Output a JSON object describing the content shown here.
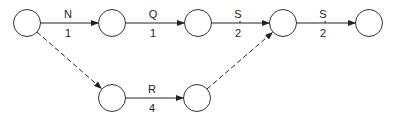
{
  "diagram": {
    "type": "activity-network",
    "nodes": [
      {
        "id": "n1",
        "x": 27,
        "y": 23
      },
      {
        "id": "n2",
        "x": 112,
        "y": 23
      },
      {
        "id": "n3",
        "x": 198,
        "y": 23
      },
      {
        "id": "n4",
        "x": 283,
        "y": 23
      },
      {
        "id": "n5",
        "x": 369,
        "y": 23
      },
      {
        "id": "n6",
        "x": 112,
        "y": 98
      },
      {
        "id": "n7",
        "x": 197,
        "y": 98
      }
    ],
    "edges": [
      {
        "from": "n1",
        "to": "n2",
        "activity": "N",
        "duration": "1",
        "style": "solid"
      },
      {
        "from": "n2",
        "to": "n3",
        "activity": "Q",
        "duration": "1",
        "style": "solid"
      },
      {
        "from": "n3",
        "to": "n4",
        "activity": "S",
        "duration": "2",
        "style": "solid"
      },
      {
        "from": "n4",
        "to": "n5",
        "activity": "S",
        "duration": "2",
        "style": "solid"
      },
      {
        "from": "n6",
        "to": "n7",
        "activity": "R",
        "duration": "4",
        "style": "solid"
      },
      {
        "from": "n1",
        "to": "n6",
        "activity": "",
        "duration": "",
        "style": "dashed"
      },
      {
        "from": "n7",
        "to": "n4",
        "activity": "",
        "duration": "",
        "style": "dashed"
      }
    ]
  }
}
